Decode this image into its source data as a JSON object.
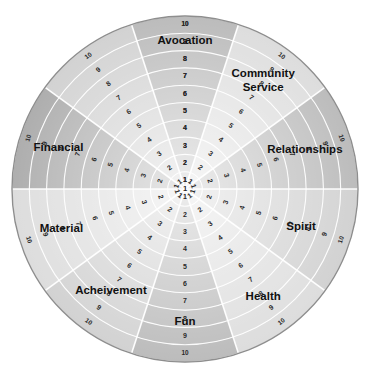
{
  "diagram": {
    "type": "radial-wheel-chart",
    "center": {
      "x": 185,
      "y": 189
    },
    "radius": 173,
    "rings": 10,
    "ring_scale_min": 1,
    "ring_scale_max": 10,
    "outline_color": "#8e8e8e",
    "ring_line_color": "#ffffff",
    "spoke_line_color": "#ffffff",
    "label_color": "#111111",
    "tick_color": "#2a2a2a",
    "shade_light": "#dcdcdc",
    "shade_mid": "#d0d0d0",
    "shade_dark": "#b9b9b9",
    "shade_darker": "#ababab",
    "scale_labels": [
      "1",
      "2",
      "3",
      "4",
      "5",
      "6",
      "7",
      "8",
      "9",
      "10"
    ],
    "sectors": [
      {
        "id": "avocation",
        "label": "Avocation",
        "start_deg": -108,
        "end_deg": -72,
        "tone": "dark",
        "label_radius": 148,
        "label_size": 11.5,
        "lines": [
          "Avocation"
        ]
      },
      {
        "id": "community-service",
        "label": "Community Service",
        "start_deg": -72,
        "end_deg": -36,
        "tone": "light",
        "label_radius": 133,
        "label_size": 11.5,
        "lines": [
          "Community",
          "Service"
        ]
      },
      {
        "id": "relationships",
        "label": "Relationships",
        "start_deg": -36,
        "end_deg": 0,
        "tone": "dark",
        "label_radius": 126,
        "label_size": 11.5,
        "lines": [
          "Relationships"
        ]
      },
      {
        "id": "spirit",
        "label": "Spirit",
        "start_deg": 0,
        "end_deg": 36,
        "tone": "mid",
        "label_radius": 122,
        "label_size": 11.5,
        "lines": [
          "Spirit"
        ]
      },
      {
        "id": "health",
        "label": "Health",
        "start_deg": 36,
        "end_deg": 72,
        "tone": "light",
        "label_radius": 133,
        "label_size": 11.5,
        "lines": [
          "Health"
        ]
      },
      {
        "id": "fun",
        "label": "Fun",
        "start_deg": 72,
        "end_deg": 108,
        "tone": "dark",
        "label_radius": 133,
        "label_size": 11.5,
        "lines": [
          "Fun"
        ]
      },
      {
        "id": "acheivement",
        "label": "Acheivement",
        "start_deg": 108,
        "end_deg": 144,
        "tone": "mid",
        "label_radius": 126,
        "label_size": 11.5,
        "lines": [
          "Acheivement"
        ]
      },
      {
        "id": "material",
        "label": "Material",
        "start_deg": 144,
        "end_deg": 180,
        "tone": "light",
        "label_radius": 130,
        "label_size": 11.5,
        "lines": [
          "Material"
        ]
      },
      {
        "id": "financial",
        "label": "Financial",
        "start_deg": 180,
        "end_deg": 216,
        "tone": "darker",
        "label_radius": 133,
        "label_size": 11.5,
        "lines": [
          "Financial"
        ]
      },
      {
        "id": "avocation-left",
        "label": "",
        "start_deg": 216,
        "end_deg": 252,
        "tone": "mid",
        "label_radius": 133,
        "label_size": 11.5,
        "lines": []
      }
    ],
    "spoke_tick_angles_deg": [
      -90,
      -54,
      -18,
      18,
      54,
      90,
      126,
      162,
      198,
      234,
      270
    ],
    "center_label": "1"
  }
}
